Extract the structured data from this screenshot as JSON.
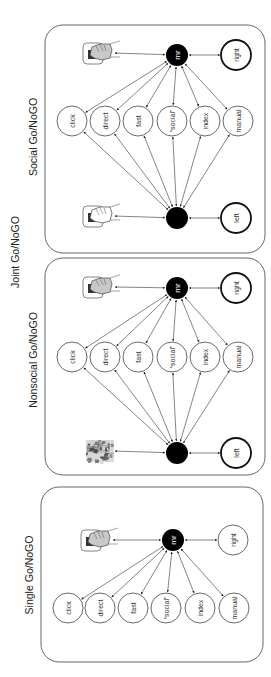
{
  "figure": {
    "group_title": "Joint Go/NoGO",
    "panels": [
      {
        "id": "social",
        "title": "Social Go/NoGO",
        "hub_top_label": "mr",
        "hub_bottom_label": "",
        "concepts": [
          "click",
          "direct",
          "fast",
          "“social”",
          "index",
          "manual"
        ],
        "side_top": "right",
        "side_bottom": "left",
        "stimulus_top": "hand-press-icon-grey",
        "stimulus_bottom": "hand-press-icon-white"
      },
      {
        "id": "nonsocial",
        "title": "Nonsocial Go/NoGO",
        "hub_top_label": "mr",
        "hub_bottom_label": "",
        "concepts": [
          "click",
          "direct",
          "fast",
          "“social”",
          "index",
          "manual"
        ],
        "side_top": "right",
        "side_bottom": "left",
        "stimulus_top": "hand-press-icon-grey",
        "stimulus_bottom": "noise-photo"
      },
      {
        "id": "single",
        "title": "Single Go/NoGO",
        "hub_top_label": "mr",
        "concepts": [
          "click",
          "direct",
          "fast",
          "“social”",
          "index",
          "manual"
        ],
        "side_top": "right",
        "stimulus_top": "hand-press-icon-grey"
      }
    ]
  }
}
